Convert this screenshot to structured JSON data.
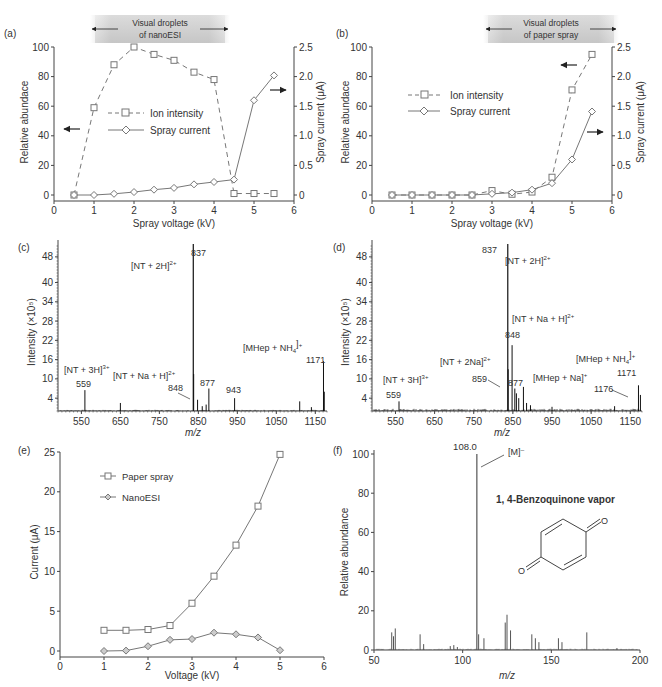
{
  "chart_data": [
    {
      "panel": "(a)",
      "type": "line",
      "banner": [
        "Visual droplets",
        "of nanoESI"
      ],
      "xlabel": "Spray voltage (kV)",
      "ylabel": "Relative abundace",
      "y2label": "Spray current (μA)",
      "xlim": [
        0,
        6
      ],
      "ylim": [
        0,
        100
      ],
      "y2lim": [
        0,
        2.5
      ],
      "x_ticks": [
        0,
        1,
        2,
        3,
        4,
        5,
        6
      ],
      "y_ticks": [
        0,
        20,
        40,
        60,
        80,
        100
      ],
      "y2_ticks": [
        "0",
        "0.5",
        "1.0",
        "1.5",
        "2.0",
        "2.5"
      ],
      "series": [
        {
          "name": "Ion intensity",
          "axis": "left",
          "style": "dashed-square",
          "x": [
            0.5,
            1,
            1.5,
            2,
            2.5,
            3,
            3.5,
            4,
            4.5,
            5,
            5.5
          ],
          "y": [
            0,
            59,
            88,
            100,
            95,
            91,
            83,
            78,
            1,
            1,
            1
          ]
        },
        {
          "name": "Spray current",
          "axis": "right",
          "style": "solid-diamond",
          "x": [
            0.5,
            1,
            1.5,
            2,
            2.5,
            3,
            3.5,
            4,
            4.5,
            5,
            5.5
          ],
          "y": [
            0,
            0,
            0.02,
            0.05,
            0.09,
            0.12,
            0.18,
            0.22,
            0.26,
            1.6,
            2.02
          ]
        }
      ]
    },
    {
      "panel": "(b)",
      "type": "line",
      "banner": [
        "Visual droplets",
        "of paper spray"
      ],
      "xlabel": "Spray voltage (kV)",
      "ylabel": "Relative abundace",
      "y2label": "Spray current (μA)",
      "xlim": [
        0,
        6
      ],
      "ylim": [
        0,
        100
      ],
      "y2lim": [
        0,
        2.5
      ],
      "x_ticks": [
        0,
        1,
        2,
        3,
        4,
        5,
        6
      ],
      "y_ticks": [
        0,
        20,
        40,
        60,
        80,
        100
      ],
      "y2_ticks": [
        "0",
        "0.5",
        "1.0",
        "1.5",
        "2.0",
        "2.5"
      ],
      "series": [
        {
          "name": "Ion intensity",
          "axis": "left",
          "style": "dashed-square",
          "x": [
            0.5,
            1,
            1.5,
            2,
            2.5,
            3,
            3.5,
            4,
            4.5,
            5,
            5.5
          ],
          "y": [
            0,
            0,
            0,
            0,
            0,
            3,
            0.5,
            2,
            12,
            71,
            95
          ]
        },
        {
          "name": "Spray current",
          "axis": "right",
          "style": "solid-diamond",
          "x": [
            0.5,
            1,
            1.5,
            2,
            2.5,
            3,
            3.5,
            4,
            4.5,
            5,
            5.5
          ],
          "y": [
            0,
            0,
            0,
            0,
            0,
            0.02,
            0.04,
            0.09,
            0.2,
            0.6,
            1.41
          ]
        }
      ]
    },
    {
      "panel": "(c)",
      "type": "bar",
      "xlabel": "m/z",
      "ylabel": "Intensity (×10⁵)",
      "xlim": [
        490,
        1180
      ],
      "ylim": [
        0,
        52
      ],
      "x_ticks": [
        550,
        650,
        750,
        850,
        950,
        1050,
        1150
      ],
      "y_ticks": [
        4,
        10,
        16,
        22,
        28,
        34,
        40,
        48
      ],
      "peaks": [
        {
          "mz": 559,
          "h": 6.5,
          "label": "559"
        },
        {
          "mz": 650,
          "h": 2.5
        },
        {
          "mz": 837,
          "h": 52,
          "label": "837"
        },
        {
          "mz": 838,
          "h": 11.5
        },
        {
          "mz": 848,
          "h": 3.5,
          "label": "848"
        },
        {
          "mz": 860,
          "h": 1.5
        },
        {
          "mz": 870,
          "h": 2
        },
        {
          "mz": 877,
          "h": 7,
          "label": "877"
        },
        {
          "mz": 943,
          "h": 4,
          "label": "943"
        },
        {
          "mz": 1110,
          "h": 3
        },
        {
          "mz": 1140,
          "h": 1.2
        },
        {
          "mz": 1171,
          "h": 15.5,
          "label": "1171"
        },
        {
          "mz": 1173,
          "h": 6
        }
      ],
      "annotations": [
        "[NT + 2H]2+",
        "[NT + 3H]3+",
        "[NT + Na + H]2+",
        "[MHep + NH4]+"
      ]
    },
    {
      "panel": "(d)",
      "type": "bar",
      "xlabel": "m/z",
      "ylabel": "Intensity (×10⁵)",
      "xlim": [
        490,
        1180
      ],
      "ylim": [
        0,
        52
      ],
      "x_ticks": [
        550,
        650,
        750,
        850,
        950,
        1050,
        1150
      ],
      "y_ticks": [
        4,
        10,
        16,
        22,
        28,
        34,
        40,
        48
      ],
      "peaks": [
        {
          "mz": 559,
          "h": 3,
          "label": "559"
        },
        {
          "mz": 837,
          "h": 52,
          "label": "837"
        },
        {
          "mz": 838,
          "h": 13
        },
        {
          "mz": 848,
          "h": 20.5,
          "label": "848"
        },
        {
          "mz": 855,
          "h": 7
        },
        {
          "mz": 859,
          "h": 5.5,
          "label": "859"
        },
        {
          "mz": 865,
          "h": 4
        },
        {
          "mz": 877,
          "h": 7.5,
          "label": "877"
        },
        {
          "mz": 885,
          "h": 2.5
        },
        {
          "mz": 895,
          "h": 1.8
        },
        {
          "mz": 950,
          "h": 1.3
        },
        {
          "mz": 1110,
          "h": 1.5
        },
        {
          "mz": 1171,
          "h": 8,
          "label": "1171"
        },
        {
          "mz": 1176,
          "h": 5,
          "label": "1176"
        }
      ],
      "annotations": [
        "[NT + 2H]2+",
        "[NT + Na + H]2+",
        "[NT + 2Na]2+",
        "[NT + 3H]3+",
        "[MHep + Na]+",
        "[MHep + NH4]+"
      ]
    },
    {
      "panel": "(e)",
      "type": "line",
      "xlabel": "Voltage (kV)",
      "ylabel": "Current (μA)",
      "xlim": [
        0,
        6
      ],
      "ylim": [
        0,
        25
      ],
      "x_ticks": [
        0,
        1,
        2,
        3,
        4,
        5,
        6
      ],
      "y_ticks": [
        0,
        5,
        10,
        15,
        20,
        25
      ],
      "legend_position": "upper-left",
      "series": [
        {
          "name": "Paper spray",
          "marker": "square",
          "x": [
            1,
            1.5,
            2,
            2.5,
            3,
            3.5,
            4,
            4.5,
            5
          ],
          "y": [
            2.6,
            2.6,
            2.7,
            3.2,
            6.0,
            9.4,
            13.3,
            18.2,
            24.7
          ]
        },
        {
          "name": "NanoESI",
          "marker": "diamond",
          "x": [
            1,
            1.5,
            2,
            2.5,
            3,
            3.5,
            4,
            4.5,
            5
          ],
          "y": [
            0,
            0.05,
            0.6,
            1.4,
            1.5,
            2.3,
            2.1,
            1.7,
            0.1
          ]
        }
      ]
    },
    {
      "panel": "(f)",
      "type": "bar",
      "title": "1, 4-Benzoquinone vapor",
      "xlabel": "m/z",
      "ylabel": "Relative abundance",
      "xlim": [
        50,
        200
      ],
      "ylim": [
        0,
        100
      ],
      "x_ticks": [
        50,
        100,
        150,
        200
      ],
      "y_ticks": [
        0,
        20,
        40,
        60,
        80,
        100
      ],
      "peaks": [
        {
          "mz": 60,
          "h": 9
        },
        {
          "mz": 61,
          "h": 7
        },
        {
          "mz": 62,
          "h": 11
        },
        {
          "mz": 76,
          "h": 8
        },
        {
          "mz": 78,
          "h": 3
        },
        {
          "mz": 93,
          "h": 2
        },
        {
          "mz": 95,
          "h": 2.5
        },
        {
          "mz": 97,
          "h": 1.5
        },
        {
          "mz": 108,
          "h": 100,
          "label": "108.0"
        },
        {
          "mz": 109,
          "h": 8
        },
        {
          "mz": 112,
          "h": 6
        },
        {
          "mz": 124,
          "h": 14
        },
        {
          "mz": 125,
          "h": 18
        },
        {
          "mz": 127,
          "h": 10
        },
        {
          "mz": 139,
          "h": 8
        },
        {
          "mz": 141,
          "h": 6
        },
        {
          "mz": 143,
          "h": 4
        },
        {
          "mz": 154,
          "h": 6
        },
        {
          "mz": 156,
          "h": 4
        },
        {
          "mz": 170,
          "h": 9
        },
        {
          "mz": 187,
          "h": 1
        }
      ],
      "annotations": [
        "[M]⁻"
      ]
    }
  ],
  "panels": {
    "a": {
      "label": "(a)",
      "banner1": "Visual droplets",
      "banner2": "of nanoESI",
      "xlabel": "Spray voltage (kV)",
      "ylabel": "Relative abundace",
      "y2label": "Spray current (μA)",
      "legend1": "Ion intensity",
      "legend2": "Spray current"
    },
    "b": {
      "label": "(b)",
      "banner1": "Visual droplets",
      "banner2": "of paper spray",
      "xlabel": "Spray voltage (kV)",
      "ylabel": "Relative abundace",
      "y2label": "Spray current (μA)",
      "legend1": "Ion intensity",
      "legend2": "Spray current"
    },
    "c": {
      "label": "(c)",
      "xlabel": "m/z",
      "ylabel": "Intensity (×10⁵)"
    },
    "d": {
      "label": "(d)",
      "xlabel": "m/z",
      "ylabel": "Intensity (×10⁵)"
    },
    "e": {
      "label": "(e)",
      "xlabel": "Voltage (kV)",
      "ylabel": "Current (μA)",
      "legend1": "Paper spray",
      "legend2": "NanoESI"
    },
    "f": {
      "label": "(f)",
      "xlabel": "m/z",
      "ylabel": "Relative abundance",
      "title": "1, 4-Benzoquinone vapor",
      "peak_label": "108.0",
      "ion_label": "[M]⁻"
    }
  }
}
